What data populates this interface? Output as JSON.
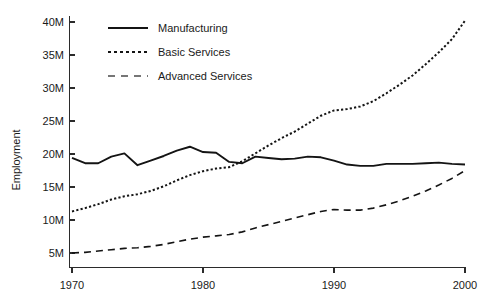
{
  "chart_data": {
    "type": "line",
    "title": "",
    "xlabel": "",
    "ylabel": "Employment",
    "xlim": [
      1970,
      2000
    ],
    "ylim": [
      3.5,
      41.5
    ],
    "grid": false,
    "legend_position": "top-left",
    "x_ticks": [
      1970,
      1980,
      1990,
      2000
    ],
    "x_tick_labels": [
      "1970",
      "1980",
      "1990",
      "2000"
    ],
    "y_ticks": [
      5,
      10,
      15,
      20,
      25,
      30,
      35,
      40
    ],
    "y_tick_labels": [
      "5M",
      "10M",
      "15M",
      "20M",
      "25M",
      "30M",
      "35M",
      "40M"
    ],
    "x": [
      1970,
      1971,
      1972,
      1973,
      1974,
      1975,
      1976,
      1977,
      1978,
      1979,
      1980,
      1981,
      1982,
      1983,
      1984,
      1985,
      1986,
      1987,
      1988,
      1989,
      1990,
      1991,
      1992,
      1993,
      1994,
      1995,
      1996,
      1997,
      1998,
      1999,
      2000
    ],
    "series": [
      {
        "name": "Manufacturing",
        "style": "solid",
        "color": "#141414",
        "values": [
          19.4,
          18.6,
          18.6,
          19.6,
          20.1,
          18.3,
          19.0,
          19.7,
          20.5,
          21.1,
          20.3,
          20.2,
          18.8,
          18.6,
          19.6,
          19.4,
          19.2,
          19.3,
          19.6,
          19.5,
          19.0,
          18.4,
          18.2,
          18.2,
          18.5,
          18.5,
          18.5,
          18.6,
          18.7,
          18.5,
          18.4
        ]
      },
      {
        "name": "Basic Services",
        "style": "dotted",
        "color": "#141414",
        "values": [
          11.3,
          11.8,
          12.4,
          13.1,
          13.6,
          13.9,
          14.4,
          15.1,
          16.0,
          16.8,
          17.4,
          17.8,
          18.0,
          18.9,
          20.1,
          21.3,
          22.4,
          23.4,
          24.6,
          25.8,
          26.6,
          26.8,
          27.2,
          28.0,
          29.2,
          30.5,
          31.9,
          33.6,
          35.4,
          37.4,
          40.2
        ]
      },
      {
        "name": "Advanced Services",
        "style": "dashed",
        "color": "#4a4a4a",
        "values": [
          5.0,
          5.1,
          5.3,
          5.5,
          5.7,
          5.8,
          6.0,
          6.3,
          6.7,
          7.1,
          7.4,
          7.6,
          7.8,
          8.2,
          8.8,
          9.3,
          9.8,
          10.3,
          10.8,
          11.3,
          11.6,
          11.5,
          11.5,
          11.8,
          12.3,
          12.9,
          13.6,
          14.4,
          15.3,
          16.3,
          17.5
        ]
      }
    ]
  },
  "legend": {
    "items": [
      {
        "label": "Manufacturing",
        "style": "solid"
      },
      {
        "label": "Basic Services",
        "style": "dotted"
      },
      {
        "label": "Advanced Services",
        "style": "dashed"
      }
    ]
  }
}
